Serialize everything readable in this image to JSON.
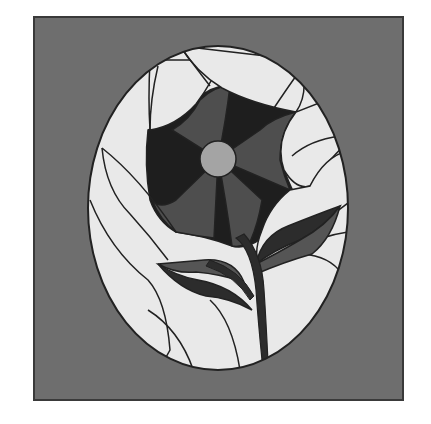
{
  "artwork": {
    "title": "Stained glass flower in oval",
    "style": "stained-glass",
    "colors": {
      "page_background": "#ffffff",
      "frame_fill": "#6e6e6e",
      "frame_border": "#3a3a3a",
      "oval_light": "#e9e9e9",
      "petal_dark": "#1e1e1e",
      "petal_mid": "#4e4e4e",
      "center_disc": "#a4a4a4",
      "leaf_dark": "#2c2c2c",
      "leaf_mid": "#555555",
      "lead_line": "#222222"
    },
    "frame": {
      "x": 34,
      "y": 17,
      "width": 369,
      "height": 383
    },
    "oval": {
      "cx": 218,
      "cy": 208,
      "rx": 130,
      "ry": 162
    },
    "flower_center": {
      "cx": 218,
      "cy": 159,
      "r": 18
    },
    "petal_count": 4,
    "leaf_count": 4
  }
}
